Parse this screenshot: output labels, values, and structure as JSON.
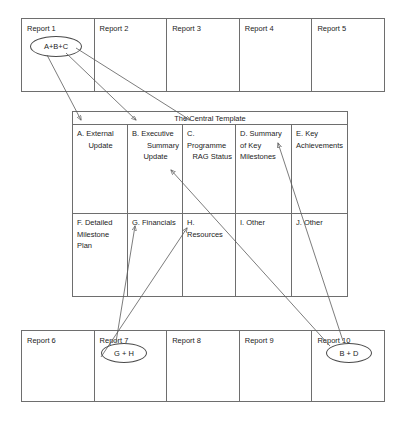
{
  "diagram": {
    "title": "The Central Template",
    "top_reports": [
      {
        "label": "Report 1"
      },
      {
        "label": "Report 2"
      },
      {
        "label": "Report 3"
      },
      {
        "label": "Report 4"
      },
      {
        "label": "Report 5"
      }
    ],
    "bottom_reports": [
      {
        "label": "Report 6"
      },
      {
        "label": "Report 7"
      },
      {
        "label": "Report 8"
      },
      {
        "label": "Report 9"
      },
      {
        "label": "Report 10"
      }
    ],
    "template_row1": [
      {
        "line1": "A. External",
        "line2": "Update"
      },
      {
        "line1": "B. Executive",
        "line2": "Summary",
        "line3": "Update"
      },
      {
        "line1": "C. Programme",
        "line2": "RAG Status"
      },
      {
        "line1": "D. Summary",
        "line2": "of Key",
        "line3": "Milestones"
      },
      {
        "line1": "E. Key",
        "line2": "Achievements"
      }
    ],
    "template_row2": [
      {
        "line1": "F. Detailed",
        "line2": "Milestone Plan"
      },
      {
        "line1": "G. Financials"
      },
      {
        "line1": "H. Resources"
      },
      {
        "line1": "I. Other"
      },
      {
        "line1": "J. Other"
      }
    ],
    "ellipses": {
      "top": "A+B+C",
      "bottom_left": "G + H",
      "bottom_right": "B + D"
    },
    "colors": {
      "line": "#6e6e6e",
      "connector": "#5a5a5a",
      "text": "#1d1d1d",
      "background": "#ffffff"
    }
  }
}
